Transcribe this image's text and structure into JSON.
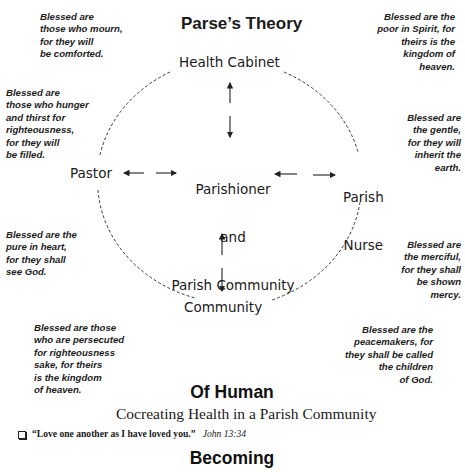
{
  "header": {
    "title": "Parse’s Theory"
  },
  "subtitle": {
    "line1": "Of Human",
    "line2": "Becoming"
  },
  "diagram": {
    "nodes": {
      "top": "Health Cabinet",
      "left": "Pastor",
      "center_line1": "Parishioner",
      "center_line2": "and",
      "center_line3": "Parish Community",
      "right_line1": "Parish",
      "right_line2": "Nurse",
      "bottom": "Community"
    },
    "icons": [
      "double-arrow-vertical-top",
      "double-arrow-horizontal-left",
      "double-arrow-horizontal-right",
      "double-arrow-vertical-bottom",
      "dashed-circle"
    ],
    "stroke_color": "#333333"
  },
  "beatitudes": {
    "mourn": "Blessed are\nthose who mourn,\nfor they will\nbe comforted.",
    "poor": "Blessed are the\npoor in Spirit, for\ntheirs is the\nkingdom of\nheaven.",
    "hunger": "Blessed are\nthose who hunger\nand thirst for\nrighteousness,\nfor they will\nbe filled.",
    "gentle": "Blessed are\nthe gentle,\nfor they will\ninherit the\nearth.",
    "pure": "Blessed are the\npure in heart,\nfor they shall\nsee God.",
    "merciful": "Blessed are\nthe merciful,\nfor they shall\nbe shown\nmercy.",
    "persecuted": "Blessed are those\nwho are persecuted\nfor righteousness\nsake, for theirs\nis the kingdom\nof heaven.",
    "peacemakers": "Blessed are the\npeacemakers, for\nthey shall be called\nthe children\nof God."
  },
  "footer": {
    "title": "Cocreating Health in a Parish Community",
    "quote": "“Love one another as I have loved you.”",
    "reference": "John 13:34"
  }
}
